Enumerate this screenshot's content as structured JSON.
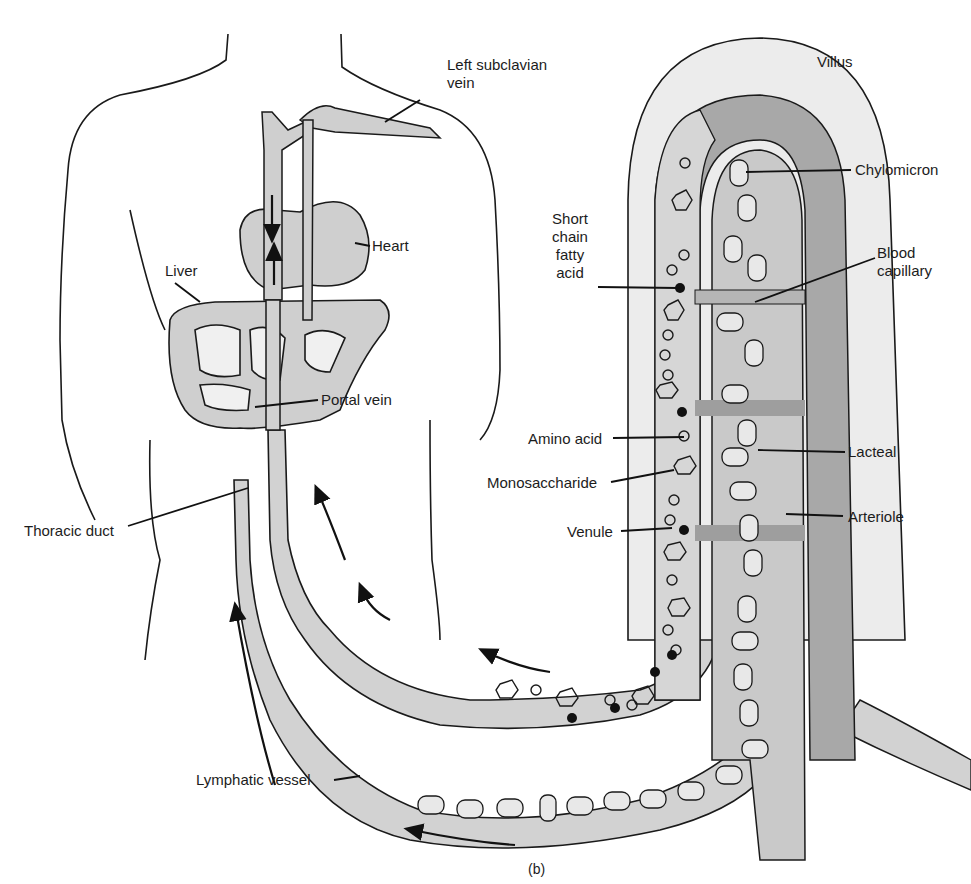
{
  "figure": {
    "panel_label": "(b)",
    "colors": {
      "outline": "#1a1a1a",
      "vessel_fill": "#d2d2d2",
      "villus_outer": "#ececec",
      "capillary_dark": "#a8a8a8",
      "lacteal_fill": "#c9c9c9",
      "organ_fill": "#cfcfcf",
      "background": "#ffffff"
    }
  },
  "labels": {
    "left_subclavian_vein": "Left subclavian\nvein",
    "villus": "Villus",
    "chylomicron": "Chylomicron",
    "heart": "Heart",
    "short_chain_fatty_acid": "Short\nchain\nfatty\nacid",
    "blood_capillary": "Blood\ncapillary",
    "liver": "Liver",
    "portal_vein": "Portal vein",
    "amino_acid": "Amino acid",
    "lacteal": "Lacteal",
    "monosaccharide": "Monosaccharide",
    "thoracic_duct": "Thoracic duct",
    "venule": "Venule",
    "arteriole": "Arteriole",
    "lymphatic_vessel": "Lymphatic vessel"
  }
}
